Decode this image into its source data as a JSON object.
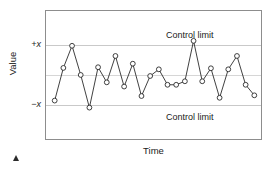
{
  "chart_data": {
    "type": "line",
    "title": "",
    "subtitle": "",
    "xlabel": "Time",
    "ylabel": "Value",
    "grid": true,
    "legend_position": "none",
    "xlim": [
      0,
      25
    ],
    "ylim": [
      -1.85,
      1.85
    ],
    "x_tick_labels": [],
    "y_tick_labels": [
      "+x",
      "−x"
    ],
    "y_tick_values": [
      1.0,
      -1.0
    ],
    "gridline_values": [
      1.0,
      0.0,
      -1.0
    ],
    "annotations": [
      {
        "text": "Control limit",
        "x": 18.0,
        "y": 1.45
      },
      {
        "text": "Control limit",
        "x": 18.0,
        "y": -1.45
      }
    ],
    "series": [
      {
        "name": "measurement",
        "marker": "circle-open",
        "color": "#2b2b2b",
        "x": [
          1,
          2,
          3,
          4,
          5,
          6,
          7,
          8,
          9,
          10,
          11,
          12,
          13,
          14,
          15,
          16,
          17,
          18,
          19,
          20,
          21,
          22,
          23,
          24
        ],
        "values": [
          -0.7,
          0.23,
          0.86,
          0.03,
          -0.9,
          0.25,
          -0.18,
          0.57,
          -0.3,
          0.35,
          -0.57,
          0.0,
          0.19,
          -0.25,
          -0.25,
          -0.15,
          1.0,
          -0.15,
          0.22,
          -0.62,
          0.19,
          0.57,
          -0.25,
          -0.55
        ]
      }
    ],
    "colors": {
      "line": "#2b2b2b",
      "marker_fill": "#ffffff",
      "grid": "#c9c9c9",
      "frame": "#8d8d8d",
      "text": "#1a1a1a",
      "background": "#ffffff"
    }
  },
  "axes": {
    "y_title": "Value",
    "x_title": "Time",
    "y_tick_top": "+x",
    "y_tick_bottom": "−x"
  },
  "labels": {
    "control_limit_upper": "Control limit",
    "control_limit_lower": "Control limit"
  }
}
